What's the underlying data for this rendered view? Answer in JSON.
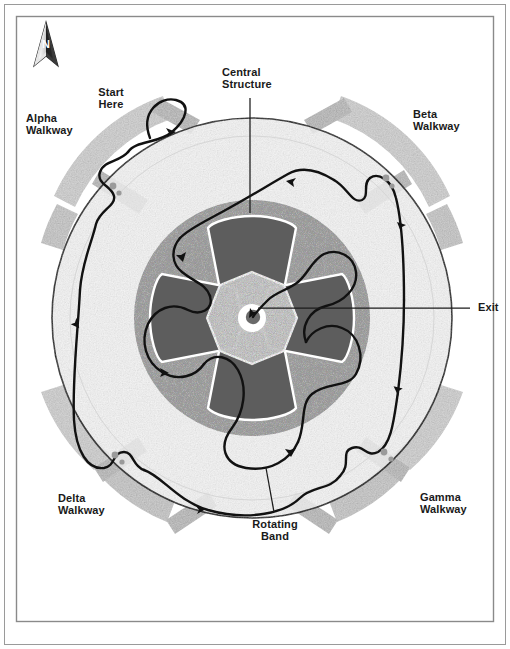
{
  "figure": {
    "kind": "route-map-diagram",
    "frame": {
      "outer_border_color": "#8f8f8f",
      "inner_border_color": "#8f8f8f",
      "background": "#ffffff"
    }
  },
  "compass": {
    "name": "north-arrow",
    "letter": "N"
  },
  "labels": [
    {
      "id": "start-here",
      "text": "Start\nHere",
      "x": 95,
      "y": 86,
      "align": "center",
      "size": 11
    },
    {
      "id": "alpha-walkway",
      "text": "Alpha\nWalkway",
      "x": 26,
      "y": 112,
      "align": "left",
      "size": 11
    },
    {
      "id": "central-structure",
      "text": "Central\nStructure",
      "x": 226,
      "y": 66,
      "align": "left",
      "size": 11
    },
    {
      "id": "beta-walkway",
      "text": "Beta\nWalkway",
      "x": 413,
      "y": 108,
      "align": "left",
      "size": 11
    },
    {
      "id": "exit",
      "text": "Exit",
      "x": 478,
      "y": 300,
      "align": "left",
      "size": 11
    },
    {
      "id": "delta-walkway",
      "text": "Delta\nWalkway",
      "x": 58,
      "y": 492,
      "align": "left",
      "size": 11
    },
    {
      "id": "gamma-walkway",
      "text": "Gamma\nWalkway",
      "x": 420,
      "y": 491,
      "align": "left",
      "size": 11
    },
    {
      "id": "rotating-band",
      "text": "Rotating\nBand",
      "x": 274,
      "y": 520,
      "align": "center",
      "size": 11
    }
  ],
  "leader_lines": [
    {
      "id": "leader-central-structure",
      "from": [
        250,
        98
      ],
      "to": [
        250,
        213
      ]
    },
    {
      "id": "leader-exit",
      "from": [
        470,
        308
      ],
      "to": [
        258,
        308
      ]
    },
    {
      "id": "leader-rotating-band",
      "from": [
        274,
        512
      ],
      "to": [
        266,
        468
      ]
    }
  ],
  "colors": {
    "path_stroke": "#111111",
    "walkway_band": "#c9c9c9",
    "walkway_band_shadow": "#b0b0b0",
    "outer_disc": "#f1f1f1",
    "mid_ring": "#a8a8a8",
    "petal_dark": "#5d5d5d",
    "hub_light": "#d8d8d8",
    "hub_core_white": "#ffffff",
    "hub_dot": "#6a6a6a",
    "label_text": "#1a1a1a"
  },
  "geometry": {
    "disc_center": [
      252,
      318
    ],
    "disc_radius": 200,
    "mid_ring_radius": 118,
    "hub_radius": 46,
    "petal_count": 4
  },
  "walkways": [
    {
      "id": "walkway-alpha",
      "label": "Alpha Walkway",
      "quadrant": "upper-left"
    },
    {
      "id": "walkway-beta",
      "label": "Beta Walkway",
      "quadrant": "upper-right"
    },
    {
      "id": "walkway-gamma",
      "label": "Gamma Walkway",
      "quadrant": "lower-right"
    },
    {
      "id": "walkway-delta",
      "label": "Delta Walkway",
      "quadrant": "lower-left"
    }
  ],
  "route": {
    "id": "main-route",
    "start_label": "Start Here",
    "end_label": "Exit",
    "arrow_count": 10
  }
}
